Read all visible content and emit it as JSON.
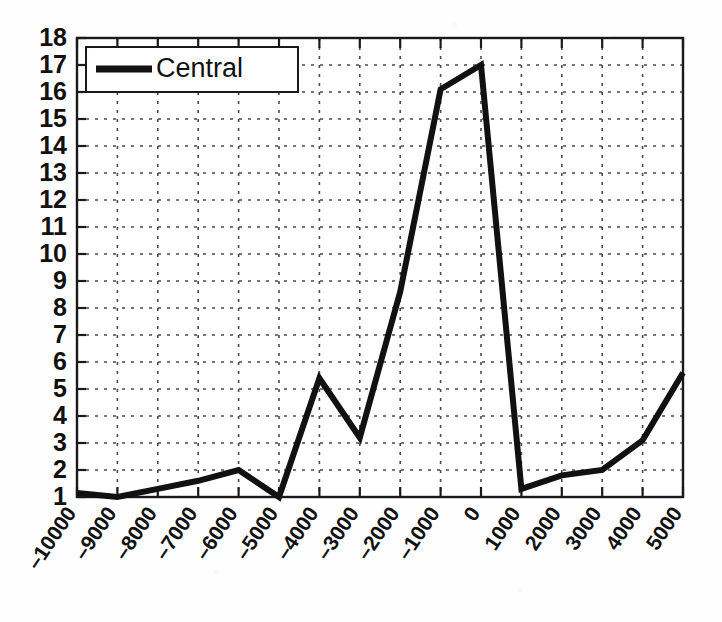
{
  "chart_data": {
    "type": "line",
    "title": "",
    "xlabel": "",
    "ylabel": "",
    "xlim": [
      -10000,
      5000
    ],
    "ylim": [
      1,
      18
    ],
    "grid": true,
    "grid_style": "dashed",
    "legend_position": "top-left",
    "x_tick_labels": [
      "–10000",
      "–9000",
      "–8000",
      "–7000",
      "–6000",
      "–5000",
      "–4000",
      "–3000",
      "–2000",
      "–1000",
      "0",
      "1000",
      "2000",
      "3000",
      "4000",
      "5000"
    ],
    "y_tick_labels": [
      "1",
      "2",
      "3",
      "4",
      "5",
      "6",
      "7",
      "8",
      "9",
      "10",
      "11",
      "12",
      "13",
      "14",
      "15",
      "16",
      "17",
      "18"
    ],
    "x": [
      -10000,
      -9000,
      -8000,
      -7000,
      -6000,
      -5000,
      -4000,
      -3000,
      -2000,
      -1000,
      0,
      1000,
      2000,
      3000,
      4000,
      5000
    ],
    "series": [
      {
        "name": "Central",
        "color": "#111111",
        "values": [
          1.15,
          1.0,
          1.3,
          1.6,
          2.0,
          1.0,
          5.4,
          3.2,
          8.6,
          16.1,
          17.0,
          1.3,
          1.8,
          2.0,
          3.1,
          5.6
        ]
      }
    ]
  },
  "legend": {
    "entries": [
      {
        "label": "Central"
      }
    ]
  },
  "axes": {
    "y_min_label": "1",
    "y_max_label": "18"
  }
}
